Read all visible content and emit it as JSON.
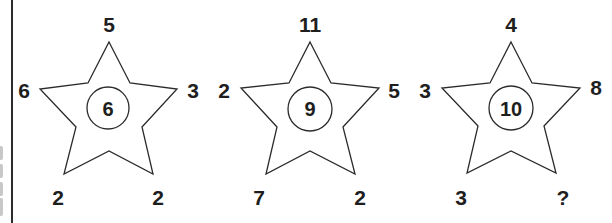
{
  "puzzle": {
    "stars": [
      {
        "top": "5",
        "left": "6",
        "right": "3",
        "bottom_left": "2",
        "bottom_right": "2",
        "center": "6"
      },
      {
        "top": "11",
        "left": "2",
        "right": "5",
        "bottom_left": "7",
        "bottom_right": "2",
        "center": "9"
      },
      {
        "top": "4",
        "left": "3",
        "right": "8",
        "bottom_left": "3",
        "bottom_right": "?",
        "center": "10"
      }
    ],
    "colors": {
      "ink": "#1e1e1e",
      "outline": "#2b2b2b",
      "background": "#ffffff"
    }
  }
}
